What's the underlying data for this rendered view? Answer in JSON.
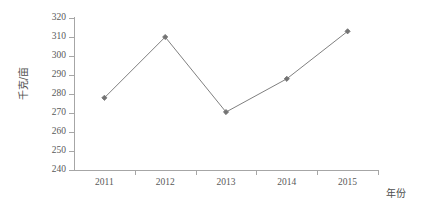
{
  "chart_data": {
    "type": "line",
    "title": "",
    "xlabel": "年份",
    "ylabel": "千克/亩",
    "categories": [
      "2011",
      "2012",
      "2013",
      "2014",
      "2015"
    ],
    "values": [
      278,
      310,
      270.5,
      288,
      313
    ],
    "series": [
      {
        "name": "千克/亩",
        "values": [
          278,
          310,
          270.5,
          288,
          313
        ]
      }
    ],
    "ylim": [
      240,
      320
    ],
    "yticks": [
      240,
      250,
      260,
      270,
      280,
      290,
      300,
      310,
      320
    ],
    "ytick_labels": [
      "240",
      "250",
      "260",
      "270",
      "280",
      "290",
      "300",
      "310",
      "320"
    ],
    "grid": false,
    "legend": false,
    "legend_position": "none",
    "marker": "diamond",
    "line_color": "#808080",
    "marker_color": "#737373",
    "axis_color": "#a6a6a6",
    "text_color": "#595959",
    "background": "#ffffff"
  }
}
